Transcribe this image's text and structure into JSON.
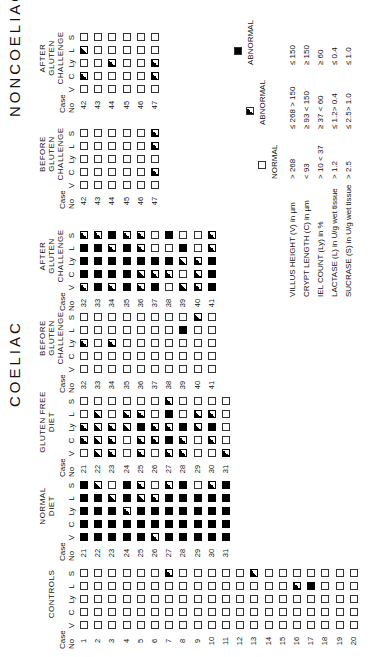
{
  "titles": {
    "coeliac": "COELIAC",
    "noncoeliac": "NONCOELIAC"
  },
  "column_headers": [
    "V",
    "C",
    "Ly",
    "L",
    "S"
  ],
  "case_header": "Case\nNo",
  "legend_code": {
    "E": "normal (open square)",
    "H": "abnormal (half-filled square)",
    "F": "abnormal (filled square)"
  },
  "groups": [
    {
      "id": "controls",
      "title": "CONTROLS",
      "cases": [
        1,
        2,
        3,
        4,
        5,
        6,
        7,
        8,
        9,
        10,
        11,
        12,
        13,
        14,
        15,
        16,
        17,
        18,
        19,
        20
      ],
      "rows": [
        [
          "E",
          "E",
          "E",
          "E",
          "E"
        ],
        [
          "E",
          "E",
          "E",
          "E",
          "E"
        ],
        [
          "E",
          "E",
          "E",
          "E",
          "E"
        ],
        [
          "E",
          "E",
          "E",
          "E",
          "E"
        ],
        [
          "E",
          "E",
          "E",
          "E",
          "E"
        ],
        [
          "E",
          "E",
          "E",
          "E",
          "E"
        ],
        [
          "E",
          "E",
          "E",
          "E",
          "H"
        ],
        [
          "E",
          "E",
          "E",
          "E",
          "E"
        ],
        [
          "E",
          "E",
          "E",
          "E",
          "E"
        ],
        [
          "E",
          "E",
          "E",
          "E",
          "E"
        ],
        [
          "E",
          "E",
          "E",
          "E",
          "E"
        ],
        [
          "E",
          "E",
          "E",
          "E",
          "E"
        ],
        [
          "E",
          "E",
          "E",
          "E",
          "H"
        ],
        [
          "E",
          "E",
          "E",
          "E",
          "E"
        ],
        [
          "E",
          "E",
          "E",
          "E",
          "E"
        ],
        [
          "E",
          "E",
          "E",
          "H",
          "E"
        ],
        [
          "E",
          "E",
          "E",
          "F",
          "E"
        ],
        [
          "E",
          "E",
          "E",
          "E",
          "E"
        ],
        [
          "E",
          "E",
          "E",
          "E",
          "E"
        ],
        [
          "E",
          "E",
          "E",
          "E",
          "E"
        ]
      ]
    },
    {
      "id": "normal-diet",
      "title": "NORMAL\nDIET",
      "cases": [
        21,
        22,
        23,
        24,
        25,
        26,
        27,
        28,
        29,
        30,
        31
      ],
      "rows": [
        [
          "F",
          "F",
          "F",
          "F",
          "F"
        ],
        [
          "F",
          "F",
          "F",
          "F",
          "H"
        ],
        [
          "F",
          "F",
          "F",
          "H",
          "E"
        ],
        [
          "F",
          "F",
          "H",
          "F",
          "F"
        ],
        [
          "F",
          "F",
          "F",
          "H",
          "H"
        ],
        [
          "H",
          "F",
          "F",
          "H",
          "E"
        ],
        [
          "F",
          "F",
          "F",
          "F",
          "H"
        ],
        [
          "F",
          "F",
          "F",
          "F",
          "F"
        ],
        [
          "F",
          "F",
          "F",
          "F",
          "E"
        ],
        [
          "F",
          "F",
          "F",
          "F",
          "H"
        ],
        [
          "F",
          "F",
          "F",
          "F",
          "F"
        ]
      ]
    },
    {
      "id": "gluten-free-diet",
      "title": "GLUTEN FREE\nDIET",
      "cases": [
        21,
        22,
        23,
        24,
        25,
        26,
        27,
        28,
        29,
        30,
        31
      ],
      "rows": [
        [
          "E",
          "H",
          "H",
          "E",
          "E"
        ],
        [
          "H",
          "H",
          "H",
          "H",
          "E"
        ],
        [
          "H",
          "H",
          "H",
          "E",
          "E"
        ],
        [
          "E",
          "E",
          "H",
          "H",
          "E"
        ],
        [
          "H",
          "H",
          "F",
          "H",
          "E"
        ],
        [
          "E",
          "H",
          "H",
          "E",
          "E"
        ],
        [
          "H",
          "F",
          "H",
          "F",
          "H"
        ],
        [
          "H",
          "H",
          "F",
          "E",
          "E"
        ],
        [
          "E",
          "E",
          "H",
          "H",
          "E"
        ],
        [
          "E",
          "H",
          "F",
          "H",
          "E"
        ],
        [
          "H",
          "E",
          "E",
          "E",
          "E"
        ]
      ]
    },
    {
      "id": "coeliac-before-challenge",
      "title": "BEFORE\nGLUTEN CHALLENGE",
      "cases": [
        32,
        33,
        34,
        35,
        36,
        37,
        38,
        39,
        40,
        41
      ],
      "rows": [
        [
          "E",
          "E",
          "H",
          "E",
          "E"
        ],
        [
          "E",
          "E",
          "E",
          "E",
          "E"
        ],
        [
          "E",
          "E",
          "H",
          "E",
          "E"
        ],
        [
          "E",
          "E",
          "E",
          "E",
          "E"
        ],
        [
          "E",
          "E",
          "E",
          "E",
          "E"
        ],
        [
          "E",
          "E",
          "E",
          "E",
          "E"
        ],
        [
          "E",
          "E",
          "E",
          "E",
          "E"
        ],
        [
          "E",
          "E",
          "E",
          "F",
          "E"
        ],
        [
          "E",
          "E",
          "E",
          "E",
          "H"
        ],
        [
          "E",
          "E",
          "E",
          "E",
          "E"
        ]
      ]
    },
    {
      "id": "coeliac-after-challenge",
      "title": "AFTER\nGLUTEN CHALLENGE",
      "cases": [
        32,
        33,
        34,
        35,
        36,
        37,
        38,
        39,
        40,
        41
      ],
      "rows": [
        [
          "H",
          "F",
          "F",
          "F",
          "H"
        ],
        [
          "F",
          "F",
          "F",
          "F",
          "H"
        ],
        [
          "H",
          "F",
          "F",
          "H",
          "F"
        ],
        [
          "F",
          "F",
          "F",
          "F",
          "H"
        ],
        [
          "H",
          "H",
          "F",
          "H",
          "H"
        ],
        [
          "F",
          "H",
          "F",
          "E",
          "E"
        ],
        [
          "E",
          "H",
          "F",
          "E",
          "F"
        ],
        [
          "H",
          "E",
          "H",
          "F",
          "E"
        ],
        [
          "H",
          "H",
          "H",
          "E",
          "E"
        ],
        [
          "F",
          "F",
          "F",
          "H",
          "H"
        ]
      ]
    },
    {
      "id": "noncoeliac-before-challenge",
      "title": "BEFORE\nGLUTEN CHALLENGE",
      "cases": [
        42,
        43,
        44,
        45,
        46,
        47
      ],
      "rows": [
        [
          "E",
          "E",
          "E",
          "E",
          "E"
        ],
        [
          "E",
          "E",
          "E",
          "E",
          "E"
        ],
        [
          "E",
          "E",
          "E",
          "E",
          "E"
        ],
        [
          "E",
          "E",
          "E",
          "E",
          "E"
        ],
        [
          "E",
          "E",
          "E",
          "E",
          "E"
        ],
        [
          "E",
          "H",
          "E",
          "H",
          "H"
        ]
      ]
    },
    {
      "id": "noncoeliac-after-challenge",
      "title": "AFTER\nGLUTEN CHALLENGE",
      "cases": [
        42,
        43,
        44,
        45,
        46,
        47
      ],
      "rows": [
        [
          "E",
          "H",
          "E",
          "H",
          "E"
        ],
        [
          "E",
          "E",
          "E",
          "E",
          "E"
        ],
        [
          "E",
          "E",
          "H",
          "E",
          "E"
        ],
        [
          "E",
          "E",
          "E",
          "E",
          "E"
        ],
        [
          "E",
          "E",
          "E",
          "E",
          "E"
        ],
        [
          "E",
          "H",
          "H",
          "E",
          "E"
        ]
      ]
    }
  ],
  "legend": {
    "headers": [
      "NORMAL",
      "ABNORMAL",
      "ABNORMAL"
    ],
    "params": [
      {
        "label": "VILLUS HEIGHT (V)  in µm",
        "normal": "> 268",
        "half": "≤ 268 > 150",
        "full": "≤ 150"
      },
      {
        "label": "CRYPT LENGTH (C)  in µm",
        "normal": "< 93",
        "half": "≥ 93 < 150",
        "full": "≥ 150"
      },
      {
        "label": "IEL COUNT (Ly)  in %",
        "normal": "> 10 < 37",
        "half": "≥ 37 < 60",
        "full": "≥ 60"
      },
      {
        "label": "LACTASE (L) in U/g wet tissue",
        "normal": "> 1.2",
        "half": "≤ 1.2> 0.4",
        "full": "≤ 0.4"
      },
      {
        "label": "SUCRASE (S) in U/g wet tissue",
        "normal": "> 2.5",
        "half": "≤ 2.5> 1.0",
        "full": "≤ 1.0"
      }
    ]
  }
}
